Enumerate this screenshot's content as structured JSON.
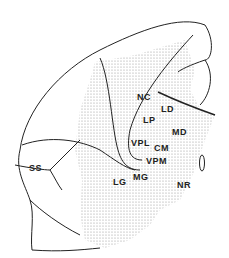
{
  "diagram": {
    "labels": {
      "nc": "NC",
      "ld": "LD",
      "lp": "LP",
      "md": "MD",
      "vpl": "VPL",
      "cm": "CM",
      "vpm": "VPM",
      "lg": "LG",
      "mg": "MG",
      "nr": "NR",
      "ss": "SS"
    },
    "colors": {
      "ink": "#222222",
      "stipple": "#bdbdbd",
      "background": "#ffffff"
    }
  }
}
